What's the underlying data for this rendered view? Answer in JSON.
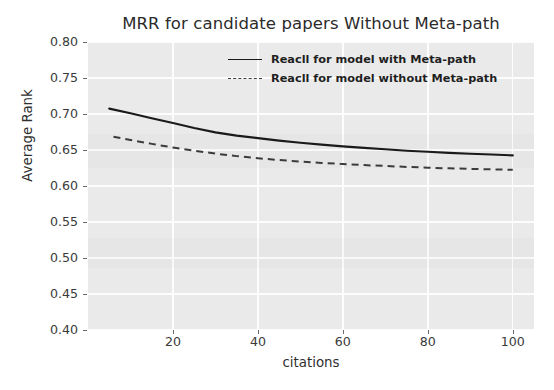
{
  "chart_data": {
    "type": "line",
    "title": "MRR for candidate papers Without Meta-path",
    "xlabel": "citations",
    "ylabel": "Average Rank",
    "xlim": [
      0,
      105
    ],
    "ylim": [
      0.4,
      0.8
    ],
    "xticks": [
      20,
      40,
      60,
      80,
      100
    ],
    "xtick_labels": [
      "20",
      "40",
      "60",
      "80",
      "100"
    ],
    "yticks": [
      0.4,
      0.45,
      0.5,
      0.55,
      0.6,
      0.65,
      0.7,
      0.75,
      0.8
    ],
    "ytick_labels": [
      "0.40",
      "0.45",
      "0.50",
      "0.55",
      "0.60",
      "0.65",
      "0.70",
      "0.75",
      "0.80"
    ],
    "grid": true,
    "legend_position": "upper center",
    "series": [
      {
        "name": "Reacll for model with Meta-path",
        "style": "solid",
        "color": "#1a1a1a",
        "x": [
          5,
          10,
          15,
          20,
          25,
          30,
          35,
          40,
          45,
          50,
          55,
          60,
          65,
          70,
          75,
          80,
          85,
          90,
          95,
          100
        ],
        "y": [
          0.7075,
          0.701,
          0.694,
          0.6875,
          0.6805,
          0.6745,
          0.67,
          0.6665,
          0.663,
          0.66,
          0.6575,
          0.655,
          0.653,
          0.651,
          0.649,
          0.6475,
          0.646,
          0.6448,
          0.6437,
          0.6425
        ]
      },
      {
        "name": "Reacll for model without Meta-path",
        "style": "dashed",
        "color": "#3b3b3b",
        "x": [
          6,
          10,
          15,
          20,
          25,
          30,
          35,
          40,
          45,
          50,
          55,
          60,
          65,
          70,
          75,
          80,
          85,
          90,
          95,
          100
        ],
        "y": [
          0.6685,
          0.664,
          0.6585,
          0.6535,
          0.649,
          0.645,
          0.6415,
          0.6385,
          0.636,
          0.634,
          0.632,
          0.6305,
          0.629,
          0.6278,
          0.6265,
          0.6255,
          0.6245,
          0.6238,
          0.6232,
          0.6225
        ]
      }
    ]
  },
  "legend": {
    "entries": [
      {
        "label": "Reacll for model with Meta-path"
      },
      {
        "label": "Reacll for model without Meta-path"
      }
    ]
  },
  "colors": {
    "plot_background": "#eaeaea",
    "grid": "#fdfdfd",
    "figure_background": "#ffffff",
    "solid_line": "#1a1a1a",
    "dashed_line": "#3b3b3b",
    "tick_text": "#3a3a3a",
    "title_text": "#2b2b2b"
  }
}
